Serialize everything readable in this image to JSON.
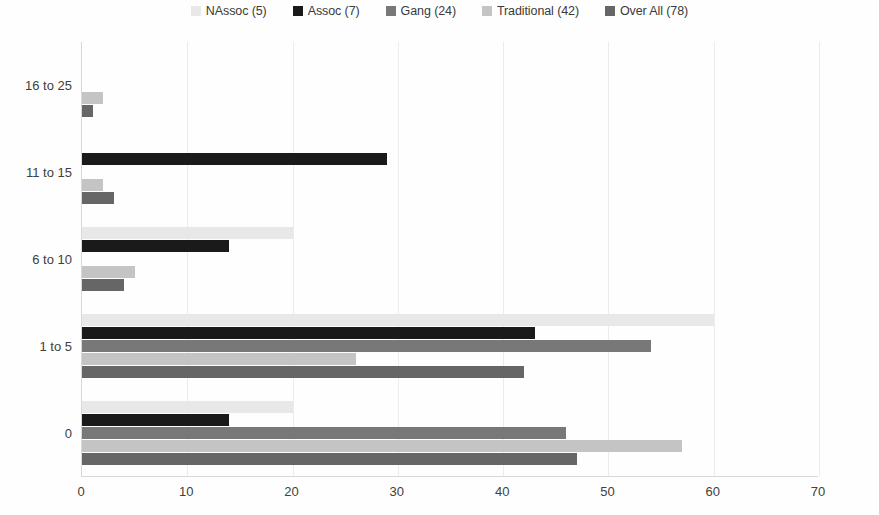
{
  "chart_data": {
    "type": "bar",
    "orientation": "horizontal",
    "title": "",
    "subtitle": "",
    "xlabel": "",
    "ylabel": "",
    "xlim": [
      0,
      70
    ],
    "xticks": [
      0,
      10,
      20,
      30,
      40,
      50,
      60,
      70
    ],
    "grid": true,
    "legend_position": "top-center",
    "categories": [
      "0",
      "1 to 5",
      "6 to 10",
      "11 to 15",
      "16 to 25"
    ],
    "categories_top_to_bottom": [
      "16 to 25",
      "11 to 15",
      "6 to 10",
      "1 to 5",
      "0"
    ],
    "series": [
      {
        "name": "NAssoc (5)",
        "color": "#e8e8e8",
        "values": [
          20,
          60,
          20,
          0,
          0
        ]
      },
      {
        "name": "Assoc (7)",
        "color": "#1a1a1a",
        "values": [
          14,
          43,
          14,
          29,
          0
        ]
      },
      {
        "name": "Gang (24)",
        "color": "#787878",
        "values": [
          46,
          54,
          0,
          0,
          0
        ]
      },
      {
        "name": "Traditional (42)",
        "color": "#c4c4c4",
        "values": [
          57,
          26,
          5,
          2,
          2
        ]
      },
      {
        "name": "Over All (78)",
        "color": "#666666",
        "values": [
          47,
          42,
          4,
          3,
          1
        ]
      }
    ]
  },
  "legend": {
    "entries": [
      {
        "label": "NAssoc (5)",
        "color": "#e8e8e8",
        "icon": "legend-swatch-icon"
      },
      {
        "label": "Assoc (7)",
        "color": "#1a1a1a",
        "icon": "legend-swatch-icon"
      },
      {
        "label": "Gang (24)",
        "color": "#787878",
        "icon": "legend-swatch-icon"
      },
      {
        "label": "Traditional (42)",
        "color": "#c4c4c4",
        "icon": "legend-swatch-icon"
      },
      {
        "label": "Over All (78)",
        "color": "#666666",
        "icon": "legend-swatch-icon"
      }
    ]
  },
  "axes": {
    "y_tick_labels": [
      "16 to 25",
      "11 to 15",
      "6 to 10",
      "1 to 5",
      "0"
    ],
    "x_tick_labels": [
      "0",
      "10",
      "20",
      "30",
      "40",
      "50",
      "60",
      "70"
    ]
  },
  "colors": {
    "grid": "#ececec",
    "axis": "#d8d8d8",
    "text": "#404040",
    "background": "#fefefe"
  }
}
